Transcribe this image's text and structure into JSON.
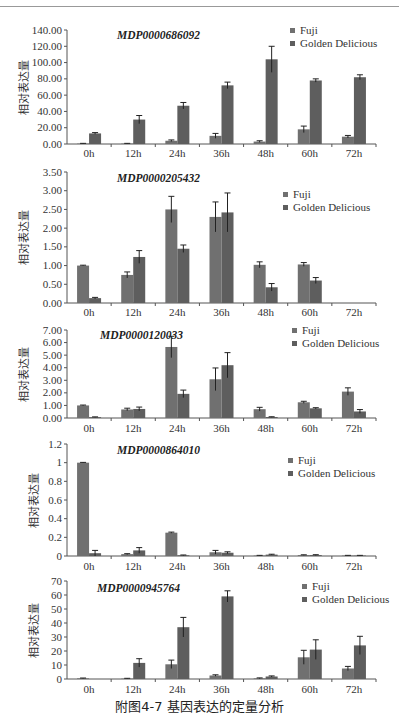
{
  "caption": "附图4-7   基因表达的定量分析",
  "colors": {
    "fuji": "#707070",
    "golden_delicious": "#5e5e5e",
    "axis": "#555555"
  },
  "chart_data": [
    {
      "type": "bar",
      "title": "MDP0000686092",
      "ylabel": "相对表达量",
      "categories": [
        "0h",
        "12h",
        "24h",
        "36h",
        "48h",
        "60h",
        "72h"
      ],
      "ylim": [
        0,
        140
      ],
      "yticks": [
        "0.00",
        "20.00",
        "40.00",
        "60.00",
        "80.00",
        "100.00",
        "120.00",
        "140.00"
      ],
      "legend": [
        "Fuji",
        "Golden Delicious"
      ],
      "series": [
        {
          "name": "Fuji",
          "values": [
            0.5,
            0.5,
            4,
            10,
            3,
            18,
            9
          ],
          "errors": [
            0.3,
            0.3,
            1,
            3,
            1,
            4,
            1.5
          ]
        },
        {
          "name": "Golden Delicious",
          "values": [
            13,
            30,
            47,
            72,
            104,
            78,
            82
          ],
          "errors": [
            1,
            5,
            4,
            4,
            16,
            2,
            3
          ]
        }
      ]
    },
    {
      "type": "bar",
      "title": "MDP0000205432",
      "ylabel": "相对表达量",
      "categories": [
        "0h",
        "12h",
        "24h",
        "36h",
        "48h",
        "60h",
        "72h"
      ],
      "ylim": [
        0,
        3.5
      ],
      "yticks": [
        "0.00",
        "0.50",
        "1.00",
        "1.50",
        "2.00",
        "2.50",
        "3.00",
        "3.50"
      ],
      "legend": [
        "Fuji",
        "Golden Delicious"
      ],
      "series": [
        {
          "name": "Fuji",
          "values": [
            1.0,
            0.75,
            2.5,
            2.3,
            1.02,
            1.03,
            0
          ],
          "errors": [
            0.01,
            0.08,
            0.35,
            0.4,
            0.08,
            0.05,
            0
          ]
        },
        {
          "name": "Golden Delicious",
          "values": [
            0.13,
            1.23,
            1.45,
            2.42,
            0.42,
            0.6,
            0
          ],
          "errors": [
            0.02,
            0.17,
            0.1,
            0.52,
            0.1,
            0.08,
            0
          ]
        }
      ]
    },
    {
      "type": "bar",
      "title": "MDP0000120033",
      "ylabel": "相对表达量",
      "categories": [
        "0h",
        "12h",
        "24h",
        "36h",
        "48h",
        "60h",
        "72h"
      ],
      "ylim": [
        0,
        7
      ],
      "yticks": [
        "0.00",
        "1.00",
        "2.00",
        "3.00",
        "4.00",
        "5.00",
        "6.00",
        "7.00"
      ],
      "legend": [
        "Fuji",
        "Golden Delicious"
      ],
      "series": [
        {
          "name": "Fuji",
          "values": [
            1.0,
            0.68,
            5.65,
            3.08,
            0.7,
            1.25,
            2.1
          ],
          "errors": [
            0.03,
            0.1,
            0.85,
            0.9,
            0.15,
            0.08,
            0.3
          ]
        },
        {
          "name": "Golden Delicious",
          "values": [
            0.07,
            0.72,
            1.92,
            4.2,
            0.08,
            0.77,
            0.52
          ],
          "errors": [
            0.02,
            0.15,
            0.3,
            1.0,
            0.02,
            0.05,
            0.15
          ]
        }
      ]
    },
    {
      "type": "bar",
      "title": "MDP0000864010",
      "ylabel": "相对表达量",
      "categories": [
        "0h",
        "12h",
        "24h",
        "36h",
        "48h",
        "60h",
        "72h"
      ],
      "ylim": [
        0,
        1.2
      ],
      "yticks": [
        "0",
        "0.2",
        "0.4",
        "0.6",
        "0.8",
        "1",
        "1.2"
      ],
      "legend": [
        "Fuji",
        "Golden Delicious"
      ],
      "series": [
        {
          "name": "Fuji",
          "values": [
            1.0,
            0.02,
            0.25,
            0.04,
            0.005,
            0.01,
            0.005
          ],
          "errors": [
            0.003,
            0.005,
            0.006,
            0.02,
            0.002,
            0.003,
            0.002
          ]
        },
        {
          "name": "Golden Delicious",
          "values": [
            0.03,
            0.06,
            0.008,
            0.035,
            0.015,
            0.01,
            0.005
          ],
          "errors": [
            0.03,
            0.03,
            0.003,
            0.01,
            0.004,
            0.004,
            0.002
          ]
        }
      ]
    },
    {
      "type": "bar",
      "title": "MDP0000945764",
      "ylabel": "相对表达量",
      "categories": [
        "0h",
        "12h",
        "24h",
        "36h",
        "48h",
        "60h",
        "72h"
      ],
      "ylim": [
        0,
        70
      ],
      "yticks": [
        "0",
        "10",
        "20",
        "30",
        "40",
        "50",
        "60",
        "70"
      ],
      "legend": [
        "Fuji",
        "Golden Delicious"
      ],
      "series": [
        {
          "name": "Fuji",
          "values": [
            0.5,
            0.3,
            10.5,
            2.5,
            0.5,
            15.5,
            7.5
          ],
          "errors": [
            0.2,
            0.2,
            3,
            0.5,
            0.3,
            5,
            1.5
          ]
        },
        {
          "name": "Golden Delicious",
          "values": [
            0,
            11.5,
            37,
            59,
            1.8,
            21,
            24
          ],
          "errors": [
            0,
            3,
            7,
            4,
            0.4,
            7,
            6.5
          ]
        }
      ]
    }
  ]
}
